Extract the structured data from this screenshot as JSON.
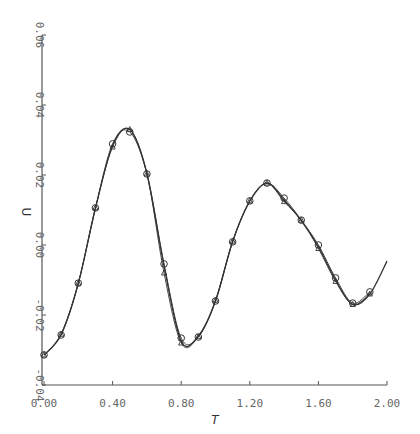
{
  "chart_data": {
    "type": "line",
    "title": "",
    "xlabel": "T",
    "ylabel": "U",
    "xlim": [
      0.0,
      2.0
    ],
    "ylim": [
      -0.04,
      0.06
    ],
    "xticks": [
      "0.00",
      "0.40",
      "0.80",
      "1.20",
      "1.60",
      "2.00"
    ],
    "yticks": [
      "-0.04",
      "-0.02",
      "0.00",
      "0.02",
      "0.04",
      "0.06"
    ],
    "grid": false,
    "legend": null,
    "x": [
      0.0,
      0.1,
      0.2,
      0.3,
      0.4,
      0.5,
      0.6,
      0.7,
      0.8,
      0.9,
      1.0,
      1.1,
      1.2,
      1.3,
      1.4,
      1.5,
      1.6,
      1.7,
      1.8,
      1.9,
      2.0
    ],
    "series": [
      {
        "name": "smooth curve",
        "marker": "none",
        "values": [
          -0.0315,
          -0.0255,
          -0.011,
          0.0105,
          0.0285,
          0.033,
          0.0205,
          -0.006,
          -0.0275,
          -0.026,
          -0.016,
          0.001,
          0.0125,
          0.0177,
          0.0128,
          0.007,
          -0.0005,
          -0.01,
          -0.017,
          -0.014,
          -0.0046
        ]
      },
      {
        "name": "circle markers",
        "marker": "circle",
        "values": [
          -0.0314,
          -0.0257,
          -0.0109,
          0.0106,
          0.0289,
          0.0323,
          0.0203,
          -0.0054,
          -0.0266,
          -0.0263,
          -0.016,
          0.0009,
          0.0126,
          0.0177,
          0.0134,
          0.0071,
          0.0,
          -0.0094,
          -0.0166,
          -0.0134,
          null
        ]
      },
      {
        "name": "triangle markers",
        "marker": "triangle",
        "values": [
          -0.0314,
          -0.0255,
          -0.0109,
          0.0106,
          0.028,
          0.033,
          0.0203,
          -0.008,
          -0.028,
          -0.0262,
          -0.0158,
          0.0011,
          0.0126,
          0.0177,
          0.0124,
          0.0071,
          -0.001,
          -0.0104,
          -0.017,
          -0.014,
          null
        ]
      }
    ]
  },
  "colors": {
    "line": "#333333",
    "axis": "#555555",
    "background": "#ffffff"
  }
}
